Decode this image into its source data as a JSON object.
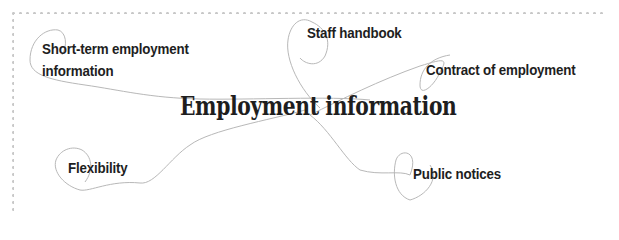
{
  "diagram": {
    "type": "mind-map",
    "central_topic": "Employment information",
    "nodes": [
      {
        "id": "short_term",
        "label_line1": "Short-term employment",
        "label_line2": "information"
      },
      {
        "id": "staff_handbook",
        "label": "Staff handbook"
      },
      {
        "id": "contract",
        "label": "Contract of employment"
      },
      {
        "id": "flexibility",
        "label": "Flexibility"
      },
      {
        "id": "public_notices",
        "label": "Public notices"
      }
    ],
    "colors": {
      "text": "#1e1e1e",
      "connector": "#b8b8b8",
      "border_dots": "#c8c8c8",
      "background": "#ffffff"
    }
  }
}
